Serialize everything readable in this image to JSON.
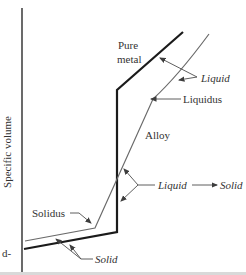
{
  "diagram": {
    "y_axis_label": "Specific volume",
    "clipped_left_text": "d-",
    "labels": {
      "pure_metal_line1": "Pure",
      "pure_metal_line2": "metal",
      "liquid_region": "Liquid",
      "liquidus": "Liquidus",
      "alloy": "Alloy",
      "transition_from": "Liquid",
      "transition_to": "Solid",
      "solidus": "Solidus",
      "solid_region": "Solid"
    },
    "colors": {
      "background": "#ffffff",
      "pure_metal_line": "#1b1b1b",
      "alloy_line": "#6a6a6a",
      "axis_line": "#2b2b2b",
      "arrow": "#4d4d4d",
      "text": "#333333",
      "bottom_edge_shadow": "#d9d9d9"
    }
  }
}
